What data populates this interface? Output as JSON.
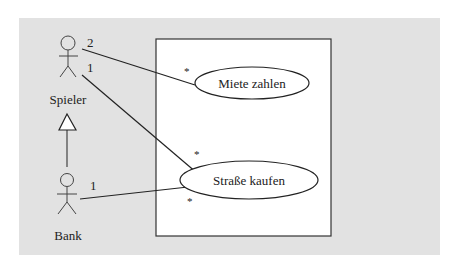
{
  "diagram": {
    "type": "uml-use-case",
    "colors": {
      "background": "#ffffff",
      "panel": "#e2e2e2",
      "system_box": "#ffffff",
      "stroke": "#333333"
    },
    "actors": [
      {
        "id": "spieler",
        "label": "Spieler"
      },
      {
        "id": "bank",
        "label": "Bank"
      }
    ],
    "use_cases": [
      {
        "id": "miete",
        "label": "Miete zahlen"
      },
      {
        "id": "strasse",
        "label": "Straße kaufen"
      }
    ],
    "associations": [
      {
        "from": "spieler",
        "to": "miete",
        "from_mult": "2",
        "to_mult": "*"
      },
      {
        "from": "spieler",
        "to": "strasse",
        "from_mult": "1",
        "to_mult": "*"
      },
      {
        "from": "bank",
        "to": "strasse",
        "from_mult": "1",
        "to_mult": "*"
      }
    ],
    "generalizations": [
      {
        "child": "bank",
        "parent": "spieler"
      }
    ]
  }
}
